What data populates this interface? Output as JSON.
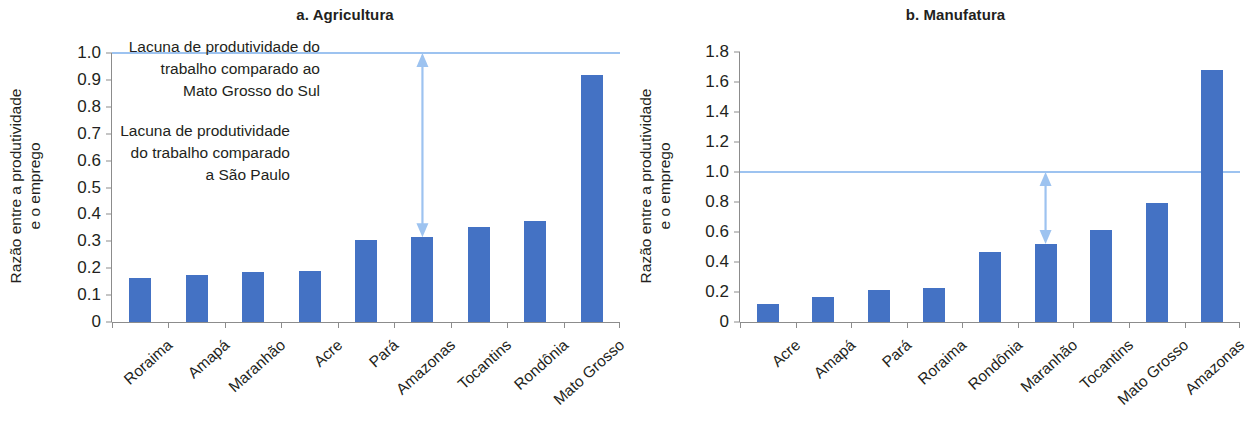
{
  "chart_data": [
    {
      "type": "bar",
      "panel_id": "a",
      "title": "a. Agricultura",
      "xlabel": "",
      "ylabel": "Razão entre a produtividade e o emprego",
      "ylabel_line1": "Razão entre a produtividade",
      "ylabel_line2": "e o emprego",
      "categories": [
        "Roraima",
        "Amapá",
        "Maranhão",
        "Acre",
        "Pará",
        "Amazonas",
        "Tocantins",
        "Rondônia",
        "Mato Grosso"
      ],
      "values": [
        0.165,
        0.175,
        0.185,
        0.19,
        0.305,
        0.315,
        0.355,
        0.375,
        0.92
      ],
      "ylim": [
        0,
        1.0
      ],
      "yticks": [
        "0",
        "0.1",
        "0.2",
        "0.3",
        "0.4",
        "0.5",
        "0.6",
        "0.7",
        "0.8",
        "0.9",
        "1.0"
      ],
      "ytick_values": [
        0,
        0.1,
        0.2,
        0.3,
        0.4,
        0.5,
        0.6,
        0.7,
        0.8,
        0.9,
        1.0
      ],
      "grid": false,
      "legend": "none",
      "reference_line": {
        "value": 1.0,
        "color": "#9dc3f0"
      },
      "annotation": {
        "lines": [
          "Lacuna de produtividade do",
          "trabalho comparado ao",
          "Mato Grosso do Sul"
        ],
        "arrow_from": 1.0,
        "arrow_to": 0.315,
        "arrow_category": "Amazonas",
        "color": "#9dc3f0"
      },
      "bar_color": "#4472c4"
    },
    {
      "type": "bar",
      "panel_id": "b",
      "title": "b. Manufatura",
      "xlabel": "",
      "ylabel": "Razão entre a produtividade e o emprego",
      "ylabel_line1": "Razão entre a produtividade",
      "ylabel_line2": "e o emprego",
      "categories": [
        "Acre",
        "Amapá",
        "Pará",
        "Roraima",
        "Rondônia",
        "Maranhão",
        "Tocantins",
        "Mato Grosso",
        "Amazonas"
      ],
      "values": [
        0.12,
        0.165,
        0.215,
        0.225,
        0.465,
        0.52,
        0.615,
        0.795,
        1.68
      ],
      "ylim": [
        0,
        1.8
      ],
      "yticks": [
        "0",
        "0.2",
        "0.4",
        "0.6",
        "0.8",
        "1.0",
        "1.2",
        "1.4",
        "1.6",
        "1.8"
      ],
      "ytick_values": [
        0,
        0.2,
        0.4,
        0.6,
        0.8,
        1.0,
        1.2,
        1.4,
        1.6,
        1.8
      ],
      "grid": false,
      "legend": "none",
      "reference_line": {
        "value": 1.0,
        "color": "#9dc3f0"
      },
      "annotation": {
        "lines": [
          "Lacuna de produtividade",
          "do trabalho comparado",
          "a São Paulo"
        ],
        "arrow_from": 1.0,
        "arrow_to": 0.52,
        "arrow_category": "Maranhão",
        "color": "#9dc3f0"
      },
      "bar_color": "#4472c4"
    }
  ],
  "panel_a": {
    "title": "a. Agricultura",
    "ylabel_line1": "Razão entre a produtividade",
    "ylabel_line2": "e o emprego",
    "annotation_line1": "Lacuna de produtividade do",
    "annotation_line2": "trabalho comparado ao",
    "annotation_line3": "Mato Grosso do Sul"
  },
  "panel_b": {
    "title": "b. Manufatura",
    "ylabel_line1": "Razão entre a produtividade",
    "ylabel_line2": "e o emprego",
    "annotation_line1": "Lacuna de produtividade",
    "annotation_line2": "do trabalho comparado",
    "annotation_line3": "a São Paulo"
  },
  "colors": {
    "bar": "#4472c4",
    "reference_line": "#9dc3f0",
    "axis": "#8c8c8c",
    "text": "#231f20"
  }
}
